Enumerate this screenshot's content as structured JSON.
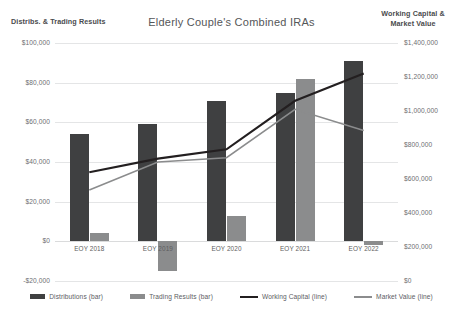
{
  "chart_data": {
    "type": "bar",
    "title": "Elderly Couple's Combined IRAs",
    "xlabel": "",
    "ylabel": "Distribs. & Trading Results",
    "y2label": "Working Capital & Market Value",
    "categories": [
      "EOY 2018",
      "EOY 2019",
      "EOY 2020",
      "EOY 2021",
      "EOY 2022"
    ],
    "ylim": [
      -20000,
      100000
    ],
    "y2lim": [
      0,
      1400000
    ],
    "ytick_labels": [
      "$100,000",
      "$80,000",
      "$60,000",
      "$40,000",
      "$20,000",
      "$0",
      "-$20,000"
    ],
    "ytick_values": [
      100000,
      80000,
      60000,
      40000,
      20000,
      0,
      -20000
    ],
    "y2tick_labels": [
      "$1,400,000",
      "$1,200,000",
      "$1,000,000",
      "$800,000",
      "$600,000",
      "$400,000",
      "$200,000",
      "$0"
    ],
    "y2tick_values": [
      1400000,
      1200000,
      1000000,
      800000,
      600000,
      400000,
      200000,
      0
    ],
    "grid": true,
    "legend_position": "bottom",
    "series": [
      {
        "name": "Distributions (bar)",
        "kind": "bar",
        "axis": "left",
        "color": "#3f4041",
        "values": [
          54000,
          59000,
          71000,
          75000,
          91000
        ]
      },
      {
        "name": "Trading Results (bar)",
        "kind": "bar",
        "axis": "left",
        "color": "#8b8c8d",
        "values": [
          4000,
          -15000,
          13000,
          82000,
          -2000
        ]
      },
      {
        "name": "Working Capital (line)",
        "kind": "line",
        "axis": "right",
        "color": "#231f20",
        "values": [
          640000,
          720000,
          775000,
          1060000,
          1220000
        ]
      },
      {
        "name": "Market Value (line)",
        "kind": "line",
        "axis": "right",
        "color": "#8b8c8d",
        "values": [
          535000,
          700000,
          725000,
          1010000,
          885000
        ]
      }
    ]
  }
}
